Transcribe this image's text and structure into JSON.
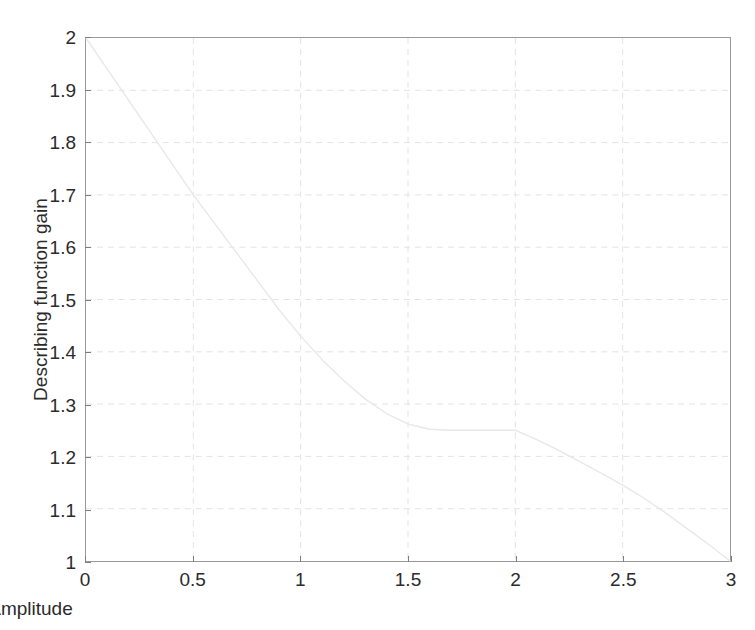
{
  "chart_data": {
    "type": "line",
    "title": "",
    "xlabel": "Amplitude",
    "ylabel": "Describing function gain",
    "xlim": [
      0,
      3
    ],
    "ylim": [
      1,
      2
    ],
    "xticks": [
      "0",
      "0.5",
      "1",
      "1.5",
      "2",
      "2.5",
      "3"
    ],
    "xtick_values": [
      0,
      0.5,
      1,
      1.5,
      2,
      2.5,
      3
    ],
    "yticks": [
      "1",
      "1.1",
      "1.2",
      "1.3",
      "1.4",
      "1.5",
      "1.6",
      "1.7",
      "1.8",
      "1.9",
      "2"
    ],
    "ytick_values": [
      1,
      1.1,
      1.2,
      1.3,
      1.4,
      1.5,
      1.6,
      1.7,
      1.8,
      1.9,
      2
    ],
    "grid": true,
    "grid_style": "dashed",
    "legend": null,
    "series": [
      {
        "name": "Describing function gain",
        "color": "#e8e8e8",
        "x": [
          0.0,
          0.1,
          0.2,
          0.3,
          0.4,
          0.5,
          0.6,
          0.7,
          0.8,
          0.9,
          1.0,
          1.1,
          1.2,
          1.3,
          1.4,
          1.5,
          1.6,
          1.7,
          1.8,
          1.9,
          2.0,
          2.1,
          2.2,
          2.3,
          2.4,
          2.5,
          2.6,
          2.7,
          2.8,
          2.9,
          3.0
        ],
        "y": [
          2.0,
          1.94,
          1.88,
          1.82,
          1.76,
          1.7,
          1.645,
          1.59,
          1.535,
          1.48,
          1.43,
          1.385,
          1.345,
          1.31,
          1.282,
          1.262,
          1.252,
          1.25,
          1.25,
          1.25,
          1.25,
          1.232,
          1.212,
          1.19,
          1.168,
          1.145,
          1.12,
          1.092,
          1.062,
          1.032,
          1.0
        ]
      }
    ]
  },
  "colors": {
    "axis": "#9a9a9a",
    "grid": "#e3e3e3",
    "text": "#2b2b2b",
    "curve": "#e8e8e8",
    "background": "#ffffff"
  }
}
